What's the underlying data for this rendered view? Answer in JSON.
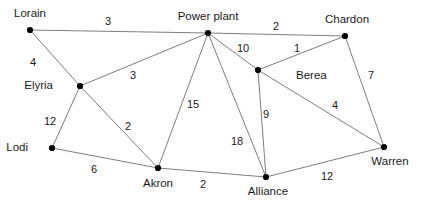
{
  "diagram": {
    "type": "undirected-weighted-graph",
    "colors": {
      "background": "#ffffff",
      "edge": "#6e6e6e",
      "node": "#000000",
      "text": "#1a1a1a"
    },
    "nodes": [
      {
        "id": "lorain",
        "label": "Lorain",
        "x": 30,
        "y": 30,
        "label_x": 30,
        "label_y": 14,
        "label_align": "center"
      },
      {
        "id": "power-plant",
        "label": "Power plant",
        "x": 208,
        "y": 33,
        "label_x": 208,
        "label_y": 17,
        "label_align": "center"
      },
      {
        "id": "chardon",
        "label": "Chardon",
        "x": 345,
        "y": 36,
        "label_x": 347,
        "label_y": 20,
        "label_align": "center"
      },
      {
        "id": "elyria",
        "label": "Elyria",
        "x": 80,
        "y": 86,
        "label_x": 53,
        "label_y": 86,
        "label_align": "right"
      },
      {
        "id": "berea",
        "label": "Berea",
        "x": 258,
        "y": 70,
        "label_x": 296,
        "label_y": 76,
        "label_align": "left"
      },
      {
        "id": "lodi",
        "label": "Lodi",
        "x": 52,
        "y": 148,
        "label_x": 28,
        "label_y": 148,
        "label_align": "right"
      },
      {
        "id": "akron",
        "label": "Akron",
        "x": 158,
        "y": 168,
        "label_x": 158,
        "label_y": 184,
        "label_align": "center"
      },
      {
        "id": "alliance",
        "label": "Alliance",
        "x": 266,
        "y": 177,
        "label_x": 268,
        "label_y": 192,
        "label_align": "center"
      },
      {
        "id": "warren",
        "label": "Warren",
        "x": 384,
        "y": 147,
        "label_x": 390,
        "label_y": 162,
        "label_align": "center"
      }
    ],
    "edges": [
      {
        "id": "lorain-power-plant",
        "from": "lorain",
        "to": "power-plant",
        "weight": "3",
        "label_x": 108,
        "label_y": 21
      },
      {
        "id": "lorain-elyria",
        "from": "lorain",
        "to": "elyria",
        "weight": "4",
        "label_x": 33,
        "label_y": 62
      },
      {
        "id": "power-plant-chardon",
        "from": "power-plant",
        "to": "chardon",
        "weight": "2",
        "label_x": 276,
        "label_y": 26
      },
      {
        "id": "power-plant-berea",
        "from": "power-plant",
        "to": "berea",
        "weight": "10",
        "label_x": 243,
        "label_y": 48
      },
      {
        "id": "chardon-berea",
        "from": "chardon",
        "to": "berea",
        "weight": "1",
        "label_x": 297,
        "label_y": 48
      },
      {
        "id": "chardon-warren",
        "from": "chardon",
        "to": "warren",
        "weight": "7",
        "label_x": 371,
        "label_y": 75
      },
      {
        "id": "elyria-power-plant",
        "from": "elyria",
        "to": "power-plant",
        "weight": "3",
        "label_x": 133,
        "label_y": 75
      },
      {
        "id": "elyria-akron",
        "from": "elyria",
        "to": "akron",
        "weight": "2",
        "label_x": 128,
        "label_y": 126
      },
      {
        "id": "elyria-lodi",
        "from": "elyria",
        "to": "lodi",
        "weight": "12",
        "label_x": 50,
        "label_y": 121
      },
      {
        "id": "power-plant-akron",
        "from": "power-plant",
        "to": "akron",
        "weight": "15",
        "label_x": 193,
        "label_y": 104
      },
      {
        "id": "power-plant-alliance",
        "from": "power-plant",
        "to": "alliance",
        "weight": "18",
        "label_x": 237,
        "label_y": 141
      },
      {
        "id": "berea-alliance",
        "from": "berea",
        "to": "alliance",
        "weight": "9",
        "label_x": 266,
        "label_y": 114
      },
      {
        "id": "berea-warren",
        "from": "berea",
        "to": "warren",
        "weight": "4",
        "label_x": 335,
        "label_y": 105
      },
      {
        "id": "lodi-akron",
        "from": "lodi",
        "to": "akron",
        "weight": "6",
        "label_x": 94,
        "label_y": 169
      },
      {
        "id": "akron-alliance",
        "from": "akron",
        "to": "alliance",
        "weight": "2",
        "label_x": 203,
        "label_y": 184
      },
      {
        "id": "alliance-warren",
        "from": "alliance",
        "to": "warren",
        "weight": "12",
        "label_x": 327,
        "label_y": 176
      }
    ]
  }
}
